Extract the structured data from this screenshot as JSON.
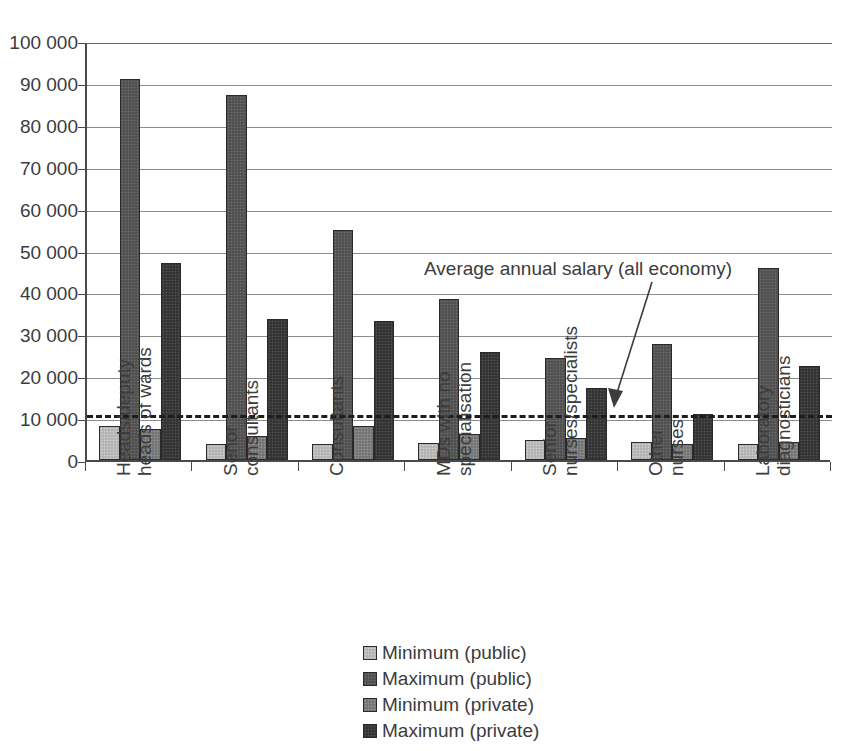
{
  "chart_data": {
    "type": "bar",
    "title": "",
    "xlabel": "",
    "ylabel": "",
    "ylim": [
      0,
      100000
    ],
    "grid": true,
    "legend_position": "bottom-center",
    "orientation": "vertical",
    "grouping": "grouped",
    "categories": [
      "Heads/deputy heads of wards",
      "Senor consultants",
      "Consultants",
      "MDs with no specialisation",
      "Senior nurses/specialists",
      "Other nurses",
      "Laboratory diagnosticians"
    ],
    "category_lines": [
      [
        "Heads/deputy",
        "heads of wards"
      ],
      [
        "Senor",
        "consultants"
      ],
      [
        "Consultants",
        ""
      ],
      [
        "MDs with no",
        "specialisation"
      ],
      [
        "Senior",
        "nurses/specialists"
      ],
      [
        "Other",
        "nurses"
      ],
      [
        "Laboratory",
        "diagnosticians"
      ]
    ],
    "ytick_labels": [
      "100 000",
      "90 000",
      "80 000",
      "70 000",
      "60 000",
      "50 000",
      "40 000",
      "30 000",
      "20 000",
      "10 000",
      "0"
    ],
    "ytick_values": [
      100000,
      90000,
      80000,
      70000,
      60000,
      50000,
      40000,
      30000,
      20000,
      10000,
      0
    ],
    "series": [
      {
        "name": "Minimum (public)",
        "color": "#b9b9b9",
        "values": [
          8200,
          3900,
          3900,
          4100,
          4700,
          4300,
          3900
        ]
      },
      {
        "name": "Maximum (public)",
        "color": "#575757",
        "values": [
          91000,
          87200,
          54800,
          38500,
          24300,
          27700,
          45800
        ]
      },
      {
        "name": "Minimum (private)",
        "color": "#7d7d7d",
        "values": [
          7500,
          5800,
          8200,
          6100,
          5200,
          3800,
          4400
        ]
      },
      {
        "name": "Maximum (private)",
        "color": "#3a3a3a",
        "values": [
          47000,
          33600,
          33100,
          25800,
          17200,
          11000,
          22400
        ]
      }
    ],
    "reference_line": {
      "label": "Average annual salary (all economy)",
      "value": 11200,
      "style": "dashed",
      "color": "#1d1d1d"
    }
  },
  "legend": {
    "items": [
      {
        "label": "Minimum (public)",
        "swatch": "s0"
      },
      {
        "label": "Maximum (public)",
        "swatch": "s1"
      },
      {
        "label": "Minimum (private)",
        "swatch": "s2"
      },
      {
        "label": "Maximum (private)",
        "swatch": "s3"
      }
    ]
  }
}
